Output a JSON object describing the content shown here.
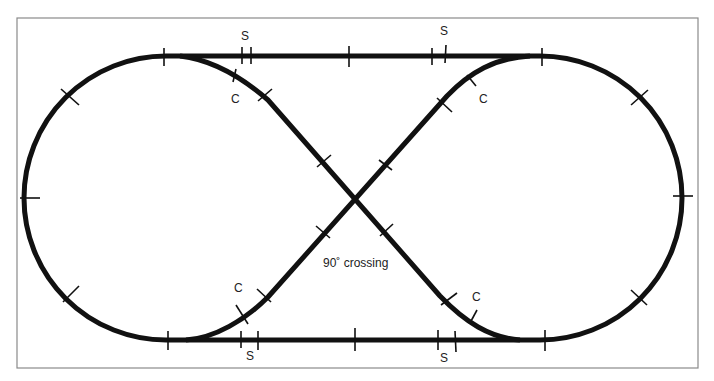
{
  "diagram": {
    "type": "track-layout",
    "colors": {
      "track": "#111111",
      "frame": "#8a8a8a",
      "background": "#ffffff",
      "text": "#222222"
    },
    "labels": {
      "crossing": "90˚ crossing",
      "switch_top_left": "S",
      "switch_top_right": "S",
      "switch_bottom_left": "S",
      "switch_bottom_right": "S",
      "curve_top_left": "C",
      "curve_top_right": "C",
      "curve_bottom_left": "C",
      "curve_bottom_right": "C"
    },
    "legend_meaning": {
      "S": "straight section",
      "C": "curved section"
    }
  }
}
